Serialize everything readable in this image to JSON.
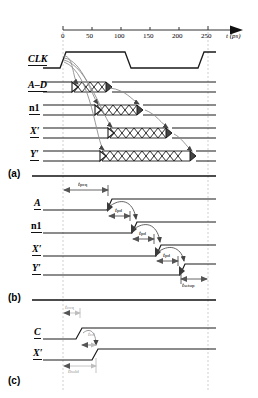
{
  "figure": {
    "axis": {
      "label": "t (ps)",
      "label_symbol": "t",
      "label_unit": "(ps)",
      "ticks": [
        0,
        50,
        100,
        150,
        200,
        250
      ],
      "tick_labels": [
        "0",
        "50",
        "100",
        "150",
        "200",
        "250"
      ],
      "range": [
        0,
        265
      ],
      "arrow": true
    },
    "panels": [
      {
        "id": "a",
        "label": "(a)"
      },
      {
        "id": "b",
        "label": "(b)"
      },
      {
        "id": "c",
        "label": "(c)"
      }
    ],
    "panel_a": {
      "signals": [
        {
          "name": "CLK",
          "italic": true
        },
        {
          "name": "A–D",
          "italic": true
        },
        {
          "name": "n1",
          "italic": false
        },
        {
          "name": "X′",
          "italic": true
        },
        {
          "name": "Y′",
          "italic": true
        }
      ],
      "clk_edges": [
        0,
        125,
        250
      ],
      "transitions": [
        {
          "signal": "A–D",
          "start": 25,
          "end": 75
        },
        {
          "signal": "n1",
          "start": 60,
          "end": 130
        },
        {
          "signal": "X′",
          "start": 85,
          "end": 180
        },
        {
          "signal": "Y′",
          "start": 75,
          "end": 215
        }
      ]
    },
    "panel_b": {
      "signals": [
        {
          "name": "A",
          "italic": true
        },
        {
          "name": "n1",
          "italic": false
        },
        {
          "name": "X′",
          "italic": true
        },
        {
          "name": "Y′",
          "italic": true
        }
      ],
      "annotations": [
        {
          "symbol": "t",
          "sub": "pcq",
          "kind": "span-arrow"
        },
        {
          "symbol": "t",
          "sub": "pd",
          "kind": "arc"
        },
        {
          "symbol": "t",
          "sub": "pd",
          "kind": "arc"
        },
        {
          "symbol": "t",
          "sub": "pd",
          "kind": "arc"
        },
        {
          "symbol": "t",
          "sub": "setup",
          "kind": "span-arrow"
        }
      ]
    },
    "panel_c": {
      "signals": [
        {
          "name": "C",
          "italic": true
        },
        {
          "name": "X′",
          "italic": true
        }
      ],
      "annotations": [
        {
          "symbol": "t",
          "sub": "ccq",
          "kind": "span-arrow"
        },
        {
          "symbol": "t",
          "sub": "cd",
          "kind": "arc"
        },
        {
          "symbol": "t",
          "sub": "hold",
          "kind": "span-arrow"
        }
      ]
    },
    "colors": {
      "waveform": "#1a1a1a",
      "gridline": "#b9b9b9",
      "annotation": "#6f6f6f",
      "faint": "#cccccc",
      "background": "#ffffff"
    }
  }
}
